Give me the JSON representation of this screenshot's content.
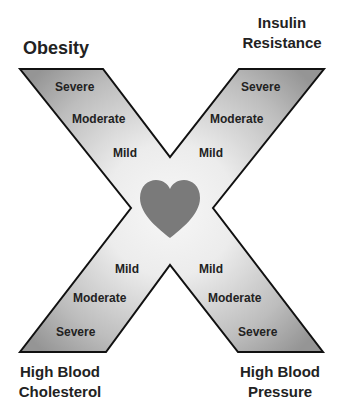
{
  "diagram": {
    "center_icon": "heart-icon",
    "colors": {
      "outline": "#111111",
      "heart": "#7a7a7a",
      "arm_dark": "#9a9a9a",
      "arm_light": "#f4f4f4",
      "text": "#222222"
    },
    "arms": [
      {
        "id": "top-left",
        "condition": "Obesity",
        "levels": [
          "Severe",
          "Moderate",
          "Mild"
        ]
      },
      {
        "id": "top-right",
        "condition": "Insulin Resistance",
        "condition_lines": [
          "Insulin",
          "Resistance"
        ],
        "levels": [
          "Severe",
          "Moderate",
          "Mild"
        ]
      },
      {
        "id": "bottom-left",
        "condition": "High Blood Cholesterol",
        "condition_lines": [
          "High Blood",
          "Cholesterol"
        ],
        "levels": [
          "Mild",
          "Moderate",
          "Severe"
        ]
      },
      {
        "id": "bottom-right",
        "condition": "High Blood Pressure",
        "condition_lines": [
          "High Blood",
          "Pressure"
        ],
        "levels": [
          "Mild",
          "Moderate",
          "Severe"
        ]
      }
    ]
  }
}
